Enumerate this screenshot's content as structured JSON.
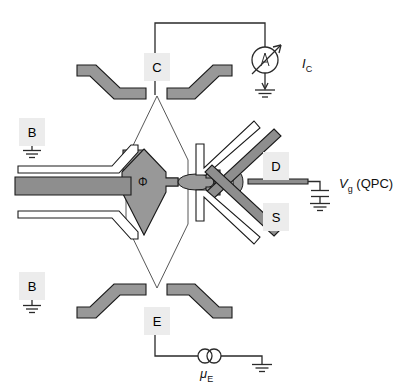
{
  "figure": {
    "background_color": "#ffffff",
    "gate_color": "#989898",
    "label_box_color": "#ececec",
    "line_color": "#1a1a1a"
  },
  "gate_labels": {
    "collector": "C",
    "base_upper": "B",
    "base_lower": "B",
    "drain": "D",
    "source": "S",
    "emitter": "E"
  },
  "annotations": {
    "collector_current": {
      "symbol": "I",
      "subscript": "C"
    },
    "gate_voltage": {
      "symbol": "V",
      "subscript": "g",
      "suffix": " (QPC)"
    },
    "emitter_chemical_potential": {
      "symbol": "μ",
      "subscript": "E"
    },
    "flux": "Φ",
    "ammeter": "A"
  },
  "components": {
    "ammeter_label": "A",
    "ground_symbol_count": 5,
    "capacitor_label": "",
    "voltage_source_label": "μ_E"
  },
  "corner_watermark": ""
}
